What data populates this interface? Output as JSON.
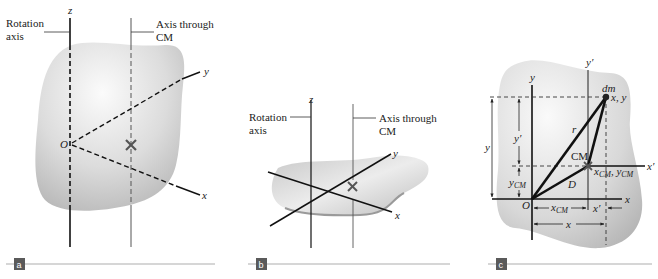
{
  "figure": {
    "panels": [
      {
        "id": "a",
        "tag": "a",
        "labels": {
          "rotation_axis_line1": "Rotation",
          "rotation_axis_line2": "axis",
          "cm_axis_line1": "Axis through",
          "cm_axis_line2": "CM",
          "z": "z",
          "y": "y",
          "x": "x",
          "origin": "O",
          "cm_marker": "×"
        }
      },
      {
        "id": "b",
        "tag": "b",
        "labels": {
          "rotation_axis_line1": "Rotation",
          "rotation_axis_line2": "axis",
          "cm_axis_line1": "Axis through",
          "cm_axis_line2": "CM",
          "z": "z",
          "y": "y",
          "x": "x",
          "cm_marker": "×"
        }
      },
      {
        "id": "c",
        "tag": "c",
        "labels": {
          "y": "y",
          "y_prime": "y′",
          "x": "x",
          "x_prime": "x′",
          "dm": "dm",
          "point_xy": "x, y",
          "r": "r",
          "cm": "CM",
          "cm_coords_x": "x",
          "cm_coords_x_sub": "CM",
          "cm_coords_sep": ", ",
          "cm_coords_y": "y",
          "cm_coords_y_sub": "CM",
          "D": "D",
          "origin": "O",
          "dim_y": "y",
          "dim_y_prime": "y′",
          "dim_ycm": "y",
          "dim_ycm_sub": "CM",
          "dim_xcm": "x",
          "dim_xcm_sub": "CM",
          "dim_x_prime": "x′",
          "dim_x": "x"
        }
      }
    ],
    "colors": {
      "tag_bg": "#5a5a5a",
      "rule": "#c8c8c8",
      "shape_light": "#f4f4f4",
      "shape_dark": "#b9b9b9",
      "ink": "#111111",
      "thin_ink": "#444444"
    }
  }
}
